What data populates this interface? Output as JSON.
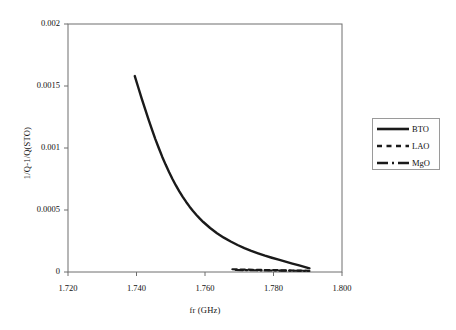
{
  "chart_data": {
    "type": "line",
    "title": "",
    "xlabel": "fr (GHz)",
    "ylabel": "1/Q-1/Q(STO)",
    "xlim": [
      1.72,
      1.8
    ],
    "ylim": [
      0,
      0.002
    ],
    "xticks": [
      "1.720",
      "1.740",
      "1.760",
      "1.780",
      "1.800"
    ],
    "xtick_values": [
      1.72,
      1.74,
      1.76,
      1.78,
      1.8
    ],
    "yticks": [
      "0",
      "0.0005",
      "0.001",
      "0.0015",
      "0.002"
    ],
    "ytick_values": [
      0,
      0.0005,
      0.001,
      0.0015,
      0.002
    ],
    "grid": false,
    "legend_position": "right",
    "series": [
      {
        "name": "BTO",
        "style": "solid",
        "color": "#1a1a1a",
        "width": 2.4,
        "x": [
          1.7395,
          1.7405,
          1.7415,
          1.7425,
          1.7435,
          1.7445,
          1.7455,
          1.7465,
          1.7475,
          1.7485,
          1.7495,
          1.7505,
          1.7515,
          1.7525,
          1.7535,
          1.7545,
          1.7555,
          1.7565,
          1.7575,
          1.7585,
          1.7595,
          1.7615,
          1.7635,
          1.7655,
          1.7675,
          1.7695,
          1.7715,
          1.7735,
          1.7755,
          1.7775,
          1.7795,
          1.7815,
          1.7835,
          1.7855,
          1.7875,
          1.7895,
          1.7905
        ],
        "y": [
          0.00158,
          0.00149,
          0.0014,
          0.001315,
          0.00123,
          0.00115,
          0.001072,
          0.001,
          0.00093,
          0.000866,
          0.000806,
          0.00075,
          0.000698,
          0.00065,
          0.000606,
          0.000565,
          0.000527,
          0.000492,
          0.00046,
          0.00043,
          0.000403,
          0.000355,
          0.000313,
          0.000277,
          0.000246,
          0.000218,
          0.000193,
          0.000171,
          0.000151,
          0.000132,
          0.000115,
          9.9e-05,
          8.3e-05,
          6.8e-05,
          5.3e-05,
          3.8e-05,
          3e-05
        ]
      },
      {
        "name": "LAO",
        "style": "dashed",
        "color": "#1a1a1a",
        "width": 2.2,
        "x": [
          1.768,
          1.77,
          1.772,
          1.774,
          1.776,
          1.778,
          1.78,
          1.782,
          1.784,
          1.786,
          1.788,
          1.79
        ],
        "y": [
          2.2e-05,
          2e-05,
          1.9e-05,
          1.8e-05,
          1.7e-05,
          1.6e-05,
          1.5e-05,
          1.4e-05,
          1.3e-05,
          1.2e-05,
          1.1e-05,
          1e-05
        ]
      },
      {
        "name": "MgO",
        "style": "dashdot",
        "color": "#1a1a1a",
        "width": 2.2,
        "x": [
          1.769,
          1.771,
          1.773,
          1.775,
          1.777,
          1.779,
          1.781,
          1.783,
          1.785,
          1.787,
          1.789,
          1.7905
        ],
        "y": [
          1.6e-05,
          1.5e-05,
          1.4e-05,
          1.4e-05,
          1.3e-05,
          1.2e-05,
          1.2e-05,
          1.1e-05,
          1e-05,
          1e-05,
          9e-06,
          8e-06
        ]
      }
    ]
  },
  "legend": {
    "entries": [
      {
        "label": "BTO",
        "style": "solid"
      },
      {
        "label": "LAO",
        "style": "dashed"
      },
      {
        "label": "MgO",
        "style": "dashdot"
      }
    ]
  },
  "colors": {
    "line": "#1a1a1a",
    "axis": "#6e6e6e",
    "legend_border": "#9a9a9a",
    "background": "#ffffff"
  }
}
